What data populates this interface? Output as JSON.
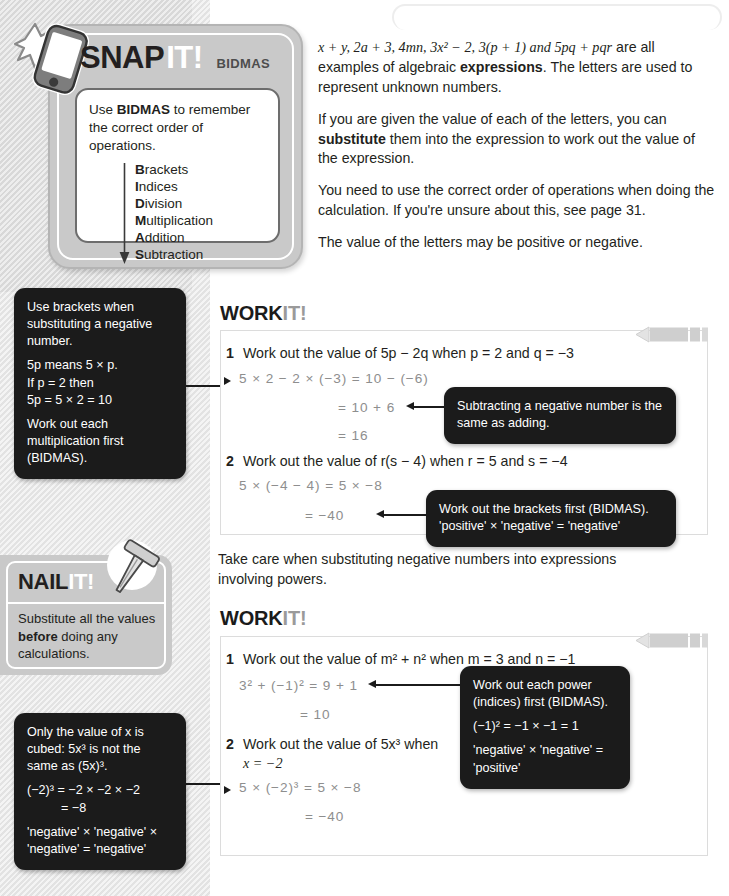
{
  "snap": {
    "brand_word": "SNAP",
    "brand_suffix": "IT!",
    "topic": "BIDMAS",
    "card_intro": "to remember the correct order of operations.",
    "card_intro_lead": "Use ",
    "card_intro_bold": "BIDMAS",
    "bidmas": [
      {
        "initial": "B",
        "rest": "rackets"
      },
      {
        "initial": "I",
        "rest": "ndices"
      },
      {
        "initial": "D",
        "rest": "ivision"
      },
      {
        "initial": "M",
        "rest": "ultiplication"
      },
      {
        "initial": "A",
        "rest": "ddition"
      },
      {
        "initial": "S",
        "rest": "ubtraction"
      }
    ]
  },
  "body": {
    "p1_math": "x + y, 2a + 3, 4mn, 3x² − 2, 3(p + 1) and 5pq + pqr",
    "p1_rest_a": " are all examples of algebraic ",
    "p1_bold": "expressions",
    "p1_rest_b": ". The letters are used to represent unknown numbers.",
    "p2_a": "If you are given the value of each of the letters, you can ",
    "p2_bold": "substitute",
    "p2_b": " them into the expression to work out the value of the expression.",
    "p3": "You need to use the correct order of operations when doing the calculation. If you're unsure about this, see page 31.",
    "p4": "The value of the letters may be positive or negative.",
    "between": "Take care when substituting negative numbers into expressions involving powers."
  },
  "notes": {
    "brackets": {
      "l1": "Use brackets when substituting a negative number.",
      "l2": "5p means 5 × p.",
      "l3": "If p = 2 then",
      "l4": "5p = 5 × 2 = 10",
      "l5": "Work out each multiplication first (BIDMAS)."
    },
    "cubed": {
      "l1": "Only the value of x is cubed: 5x³ is not the same as (5x)³.",
      "l2": "(−2)³ = −2 × −2 × −2",
      "l3": "= −8",
      "l4": "'negative' × 'negative' × 'negative' = 'negative'"
    },
    "tip1": {
      "l1": "Subtracting a negative number is the same as adding."
    },
    "tip2": {
      "l1": "Work out the brackets first (BIDMAS).",
      "l2": "'positive' × 'negative' = 'negative'"
    },
    "tip3": {
      "l1": "Work out each power (indices) first (BIDMAS).",
      "l2": "(−1)² = −1 × −1 = 1",
      "l3": "'negative' × 'negative' = 'positive'"
    }
  },
  "nail": {
    "brand_word": "NAIL",
    "brand_suffix": "IT!",
    "body_a": "Substitute all the values ",
    "body_bold": "before",
    "body_b": " doing any calculations."
  },
  "workit1": {
    "title_a": "WORK",
    "title_b": "IT!",
    "q1_num": "1",
    "q1_text": "Work out the value of 5p − 2q when p = 2 and q = −3",
    "q1_w1": "5 × 2 − 2 × (−3) = 10 − (−6)",
    "q1_w2": "= 10 + 6",
    "q1_w3": "= 16",
    "q2_num": "2",
    "q2_text": "Work out the value of r(s − 4) when r = 5 and s = −4",
    "q2_w1": "5 × (−4 − 4) = 5 × −8",
    "q2_w2": "= −40"
  },
  "workit2": {
    "title_a": "WORK",
    "title_b": "IT!",
    "q1_num": "1",
    "q1_text": "Work out the value of m² + n² when m = 3 and n = −1",
    "q1_w1": "3² + (−1)² = 9 + 1",
    "q1_w2": "= 10",
    "q2_num": "2",
    "q2_text_l1": "Work out the value of 5x³ when",
    "q2_text_l2": "x = −2",
    "q2_w1": "5 × (−2)³ = 5 × −8",
    "q2_w2": "= −40"
  },
  "icons": {
    "phone": "smartphone-flash-icon",
    "nail": "nail-icon",
    "pencil": "pencil-icon",
    "bidmas_arrow": "down-arrow-icon"
  }
}
